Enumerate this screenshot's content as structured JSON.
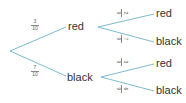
{
  "tree": {
    "line_color": "#6fb3c9",
    "level1": [
      {
        "outcome": "red",
        "prob_num": "3",
        "prob_den": "10"
      },
      {
        "outcome": "black",
        "prob_num": "7",
        "prob_den": "10"
      }
    ],
    "level2": [
      {
        "parent": "red",
        "outcome": "red",
        "prob_num": "2",
        "prob_den": "9"
      },
      {
        "parent": "red",
        "outcome": "black",
        "prob_num": "7",
        "prob_den": "9"
      },
      {
        "parent": "black",
        "outcome": "red",
        "prob_num": "3",
        "prob_den": "9"
      },
      {
        "parent": "black",
        "outcome": "black",
        "prob_num": "6",
        "prob_den": "9"
      }
    ]
  }
}
